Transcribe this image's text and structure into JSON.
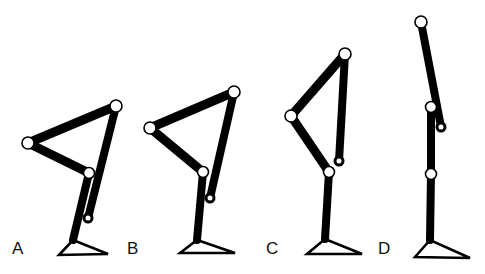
{
  "diagram": {
    "colors": {
      "line": "#000000",
      "background": "#ffffff",
      "joint_fill": "#ffffff"
    },
    "figures": [
      {
        "label": "A",
        "label_pos": [
          12,
          254
        ],
        "top": [
          116,
          106
        ],
        "left": [
          28,
          143
        ],
        "mid": [
          89,
          173
        ],
        "pin": [
          88,
          218
        ],
        "ankle": [
          73,
          240
        ],
        "foot": [
          [
            59,
            255
          ],
          [
            73,
            240
          ],
          [
            108,
            254
          ]
        ]
      },
      {
        "label": "B",
        "label_pos": [
          127,
          254
        ],
        "top": [
          234,
          92
        ],
        "left": [
          150,
          128
        ],
        "mid": [
          203,
          172
        ],
        "pin": [
          210,
          198
        ],
        "ankle": [
          197,
          240
        ],
        "foot": [
          [
            180,
            253
          ],
          [
            197,
            240
          ],
          [
            235,
            253
          ]
        ]
      },
      {
        "label": "C",
        "label_pos": [
          266,
          254
        ],
        "top": [
          345,
          54
        ],
        "left": [
          291,
          116
        ],
        "mid": [
          329,
          172
        ],
        "pin": [
          339,
          161
        ],
        "ankle": [
          325,
          239
        ],
        "foot": [
          [
            307,
            254
          ],
          [
            325,
            239
          ],
          [
            362,
            254
          ]
        ]
      },
      {
        "label": "D",
        "label_pos": [
          378,
          254
        ],
        "top": [
          421,
          22
        ],
        "left": null,
        "mid": [
          431,
          107
        ],
        "lower": [
          431,
          174
        ],
        "pin": [
          441,
          127
        ],
        "ankle": [
          430,
          240
        ],
        "foot": [
          [
            415,
            257
          ],
          [
            430,
            240
          ],
          [
            470,
            258
          ]
        ]
      }
    ]
  }
}
